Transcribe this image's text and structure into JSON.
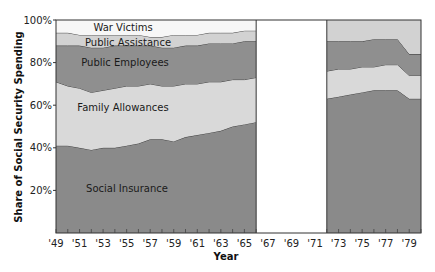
{
  "chart_data": {
    "type": "area",
    "stacked": true,
    "title": "",
    "xlabel": "Year",
    "ylabel": "Share of Social Security Spending",
    "ylim": [
      0,
      100
    ],
    "xlim": [
      1949,
      1980
    ],
    "y_ticks": [
      "20%",
      "40%",
      "60%",
      "80%",
      "100%"
    ],
    "y_tick_values": [
      20,
      40,
      60,
      80,
      100
    ],
    "x_ticks": [
      "'49",
      "'51",
      "'53",
      "'55",
      "'57",
      "'59",
      "'61",
      "'63",
      "'65",
      "'67",
      "'69",
      "'71",
      "'73",
      "'75",
      "'77",
      "'79"
    ],
    "x_tick_values": [
      1949,
      1951,
      1953,
      1955,
      1957,
      1959,
      1961,
      1963,
      1965,
      1967,
      1969,
      1971,
      1973,
      1975,
      1977,
      1979
    ],
    "grid": false,
    "legend": "inline labels",
    "data_gap": [
      1966,
      1972
    ],
    "segments": [
      {
        "x": [
          1949,
          1950,
          1951,
          1952,
          1953,
          1954,
          1955,
          1956,
          1957,
          1958,
          1959,
          1960,
          1961,
          1962,
          1963,
          1964,
          1965,
          1966
        ],
        "cumulative_tops": {
          "Social Insurance": [
            41,
            41,
            40,
            39,
            40,
            40,
            41,
            42,
            44,
            44,
            43,
            45,
            46,
            47,
            48,
            50,
            51,
            52
          ],
          "Family Allowances": [
            71,
            69,
            68,
            66,
            67,
            68,
            69,
            69,
            70,
            69,
            69,
            70,
            70,
            71,
            71,
            72,
            72,
            73
          ],
          "Public Employees": [
            88,
            88,
            88,
            87,
            87,
            88,
            88,
            88,
            88,
            87,
            87,
            88,
            88,
            89,
            89,
            89,
            90,
            90
          ],
          "Public Assistance": [
            94,
            94,
            93,
            93,
            93,
            93,
            93,
            93,
            92,
            92,
            93,
            93,
            93,
            94,
            94,
            94,
            95,
            95
          ],
          "War Victims": [
            100,
            100,
            100,
            100,
            100,
            100,
            100,
            100,
            100,
            100,
            100,
            100,
            100,
            100,
            100,
            100,
            100,
            100
          ]
        }
      },
      {
        "x": [
          1972,
          1973,
          1974,
          1975,
          1976,
          1977,
          1978,
          1979,
          1980
        ],
        "cumulative_tops": {
          "Social Insurance": [
            63,
            64,
            65,
            66,
            67,
            67,
            67,
            63,
            63
          ],
          "Family Allowances": [
            76,
            77,
            77,
            78,
            78,
            79,
            79,
            74,
            74
          ],
          "Public Employees": [
            90,
            90,
            90,
            90,
            91,
            91,
            91,
            84,
            84
          ],
          "Public Assistance": [
            100,
            100,
            100,
            100,
            100,
            100,
            100,
            100,
            100
          ]
        }
      }
    ],
    "series": [
      {
        "name": "Social Insurance",
        "color": "#8a8a8a"
      },
      {
        "name": "Family Allowances",
        "color": "#d9d9d9"
      },
      {
        "name": "Public Employees",
        "color": "#8f8f8f"
      },
      {
        "name": "Public Assistance",
        "color": "#d2d2d2"
      },
      {
        "name": "War Victims",
        "color": "#f7f7f7"
      }
    ],
    "labels": [
      {
        "text": "War Victims",
        "x": 123,
        "y": 31
      },
      {
        "text": "Public Assistance",
        "x": 128,
        "y": 46
      },
      {
        "text": "Public Employees",
        "x": 125,
        "y": 66
      },
      {
        "text": "Family Allowances",
        "x": 123,
        "y": 111
      },
      {
        "text": "Social Insurance",
        "x": 127,
        "y": 192
      }
    ]
  },
  "layout": {
    "plot_left": 56,
    "plot_right": 421,
    "plot_top": 20,
    "plot_bottom": 233
  }
}
